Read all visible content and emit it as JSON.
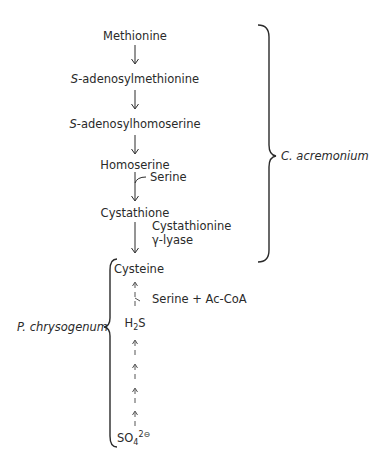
{
  "pathway": {
    "methionine": "Methionine",
    "sam_prefix": "S",
    "sam_rest": "-adenosylmethionine",
    "sah_prefix": "S",
    "sah_rest": "-adenosylhomoserine",
    "homoserine": "Homoserine",
    "serine_branch": "Serine",
    "cystathione": "Cystathione",
    "enzyme_line1": "Cystathionine",
    "enzyme_line2": "γ-lyase",
    "cysteine": "Cysteine",
    "serine_acoa": "Serine + Ac-CoA",
    "h2s_h": "H",
    "h2s_sub": "2",
    "h2s_s": "S",
    "sulfate_base": "SO",
    "sulfate_sub": "4",
    "sulfate_sup": "2⊖"
  },
  "organisms": {
    "right_brace_label": "C. acremonium",
    "left_brace_label": "P. chrysogenum"
  },
  "colors": {
    "ink": "#2a2a2a",
    "background": "#ffffff"
  }
}
